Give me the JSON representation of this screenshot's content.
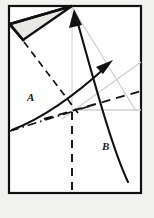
{
  "figure": {
    "type": "geometric fold diagram",
    "background_color": "#f2f2f0",
    "paper_fill": "#ffffff",
    "ink_color": "#111111",
    "flap_fill": "#e8e8e6",
    "construction_color": "#cccccc",
    "labels": [
      {
        "id": "A",
        "text": "A",
        "x": 31,
        "y": 97
      },
      {
        "id": "B",
        "text": "B",
        "x": 106,
        "y": 146
      }
    ],
    "sheet": {
      "name": "paper-sheet",
      "left": 9,
      "top": 6,
      "right": 141,
      "bottom": 193,
      "stroke_width": 2.2
    },
    "flap": {
      "name": "folded-flap-triangle",
      "points": "10,24 72,6 23,40",
      "fill": "#e8e8e6",
      "stroke_width": 2.4
    },
    "creases": {
      "dashed_fold_line": {
        "from_x": 24,
        "from_y": 41,
        "to_x": 78,
        "to_y": 112
      },
      "dashed_vertical": {
        "x": 72,
        "from_y": 112,
        "to_y": 193
      },
      "dashed_diagonal_right": {
        "from_x": 46,
        "from_y": 118,
        "to_x": 141,
        "to_y": 91
      },
      "dashdot_baseline": {
        "from_x": 10,
        "from_y": 130,
        "to_x": 88,
        "to_y": 106
      },
      "construction_vertical": {
        "x": 72,
        "from_y": 6,
        "to_y": 112
      },
      "construction_horizontal": {
        "y": 110,
        "from_x": 72,
        "to_x": 141
      },
      "construction_diagonal_down": {
        "from_x": 72,
        "from_y": 6,
        "to_x": 135,
        "to_y": 110
      },
      "construction_diagonal_up": {
        "from_x": 64,
        "from_y": 117,
        "to_x": 141,
        "to_y": 62
      }
    },
    "motion_arrows": [
      {
        "id": "A",
        "name": "fold-arrow-a",
        "path": "M 12,129 C 36,118 66,99 106,67",
        "arrow_tip_x": 109,
        "arrow_tip_y": 65,
        "arrow_angle_deg": -38
      },
      {
        "id": "B",
        "name": "fold-arrow-b",
        "path": "M 128,181 C 112,150 97,96 76,18",
        "arrow_tip_x": 75,
        "arrow_tip_y": 14,
        "arrow_angle_deg": -75
      }
    ]
  }
}
